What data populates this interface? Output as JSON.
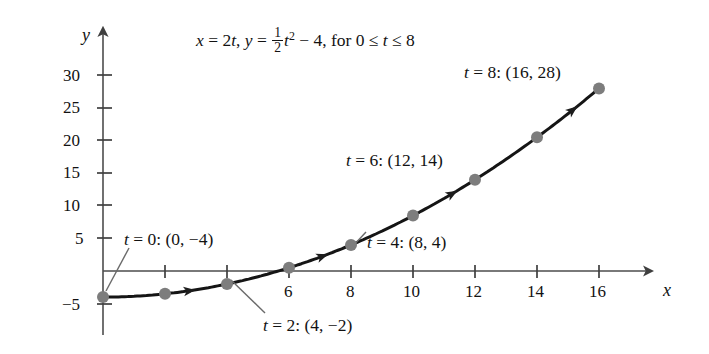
{
  "chart_data": {
    "type": "line",
    "title_parts": {
      "x_var": "x",
      "eq1": " = 2",
      "t_var1": "t",
      "comma": ", ",
      "y_var": "y",
      "eq2": " = ",
      "frac_num": "1",
      "frac_den": "2",
      "t_var2": "t",
      "exponent": "2",
      "minus4": " − 4, for 0 ",
      "le1": "≤",
      "t_var3": " t ",
      "le2": "≤",
      "tmax": " 8"
    },
    "xlabel": "x",
    "ylabel": "y",
    "parametric": {
      "x_of_t": "x = 2t",
      "y_of_t": "y = (1/2)t^2 - 4",
      "t_min": 0,
      "t_max": 8
    },
    "xlim": [
      -1,
      18
    ],
    "ylim": [
      -6,
      32
    ],
    "grid": false,
    "legend": "none",
    "x_ticks": [
      2,
      4,
      6,
      8,
      10,
      12,
      14,
      16
    ],
    "x_tick_labels": [
      "",
      "",
      "6",
      "8",
      "10",
      "12",
      "14",
      "16"
    ],
    "y_ticks": [
      5,
      10,
      15,
      20,
      25,
      30,
      -5
    ],
    "y_tick_labels": [
      "5",
      "10",
      "15",
      "20",
      "25",
      "30",
      "−5"
    ],
    "points": [
      {
        "t": 0,
        "x": 0,
        "y": -4,
        "labeled": true
      },
      {
        "t": 1,
        "x": 2,
        "y": -3.5,
        "labeled": false
      },
      {
        "t": 2,
        "x": 4,
        "y": -2,
        "labeled": true
      },
      {
        "t": 3,
        "x": 6,
        "y": 0.5,
        "labeled": false
      },
      {
        "t": 4,
        "x": 8,
        "y": 4,
        "labeled": true
      },
      {
        "t": 5,
        "x": 10,
        "y": 8.5,
        "labeled": false
      },
      {
        "t": 6,
        "x": 12,
        "y": 14,
        "labeled": true
      },
      {
        "t": 7,
        "x": 14,
        "y": 20.5,
        "labeled": false
      },
      {
        "t": 8,
        "x": 16,
        "y": 28,
        "labeled": true
      }
    ],
    "annotations": [
      {
        "id": "t0",
        "text": "t = 0: (0, −4)",
        "t_prefix": "t",
        "rest": " = 0: (0, −4)",
        "points_to": {
          "x": 0,
          "y": -4
        }
      },
      {
        "id": "t2",
        "text": "t = 2: (4, −2)",
        "t_prefix": "t",
        "rest": " = 2: (4, −2)",
        "points_to": {
          "x": 4,
          "y": -2
        }
      },
      {
        "id": "t4",
        "text": "t = 4: (8, 4)",
        "t_prefix": "t",
        "rest": " = 4: (8, 4)",
        "points_to": {
          "x": 8,
          "y": 4
        }
      },
      {
        "id": "t6",
        "text": "t = 6: (12, 14)",
        "t_prefix": "t",
        "rest": " = 6: (12, 14)",
        "points_to": {
          "x": 12,
          "y": 14
        }
      },
      {
        "id": "t8",
        "text": "t = 8: (16, 28)",
        "t_prefix": "t",
        "rest": " = 8: (16, 28)",
        "points_to": {
          "x": 16,
          "y": 28
        }
      }
    ],
    "direction_arrows": [
      {
        "at_x": 2.6,
        "note": "orientation arrow on curve"
      },
      {
        "at_x": 6.9,
        "note": "orientation arrow on curve"
      },
      {
        "at_x": 11.1,
        "note": "orientation arrow on curve"
      },
      {
        "at_x": 15.0,
        "note": "orientation arrow on curve"
      }
    ],
    "colors": {
      "curve": "#151515",
      "point_marker": "#7d7d7d",
      "axis": "#4d4d4d",
      "leader_line": "#6a6a6a",
      "text": "#121212",
      "background": "#ffffff"
    }
  },
  "axis_labels": {
    "y": "y",
    "x": "x"
  },
  "tick_text": {
    "y30": "30",
    "y25": "25",
    "y20": "20",
    "y15": "15",
    "y10": "10",
    "y5": "5",
    "yn5": "−5",
    "x6": "6",
    "x8": "8",
    "x10": "10",
    "x12": "12",
    "x14": "14",
    "x16": "16"
  },
  "annotation_text": {
    "t0_var": "t",
    "t0_rest": " = 0: (0, −4)",
    "t2_var": "t",
    "t2_rest": " = 2: (4, −2)",
    "t4_var": "t",
    "t4_rest": " = 4: (8, 4)",
    "t6_var": "t",
    "t6_rest": " = 6: (12, 14)",
    "t8_var": "t",
    "t8_rest": " = 8: (16, 28)"
  },
  "title": {
    "x_var": "x",
    "seg1": " = 2",
    "t_var1": "t",
    "seg2": ", ",
    "y_var": "y",
    "seg3": " = ",
    "num": "1",
    "den": "2",
    "t_var2": "t",
    "exp": "2",
    "seg4": " − 4, for 0 ≤ ",
    "t_var3": "t",
    "seg5": " ≤ 8"
  }
}
